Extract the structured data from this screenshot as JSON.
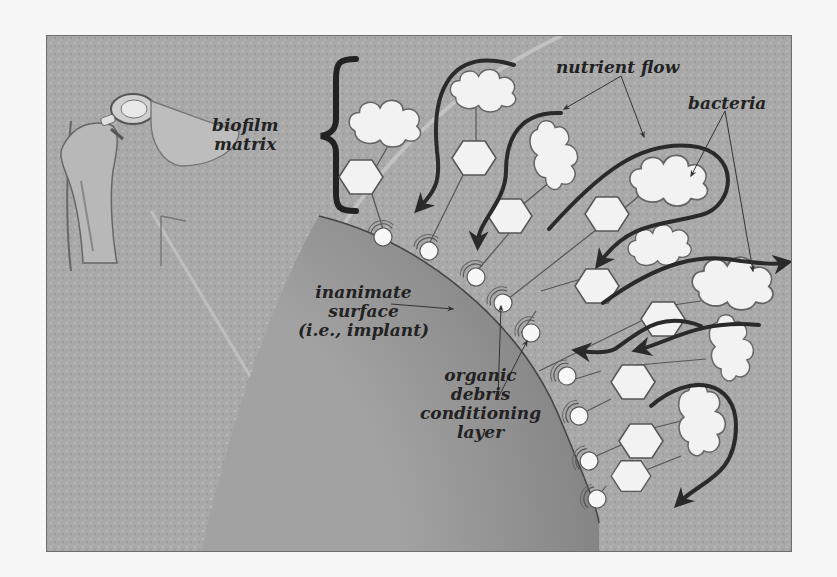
{
  "figure": {
    "labels": {
      "biofilm_matrix": [
        "biofilm",
        "matrix"
      ],
      "nutrient_flow": "nutrient flow",
      "bacteria": "bacteria",
      "inanimate_surface": [
        "inanimate",
        "surface",
        "(i.e., implant)"
      ],
      "conditioning_layer": [
        "organic",
        "debris",
        "conditioning",
        "layer"
      ]
    },
    "icons": {
      "hip_implant": "hip-joint-prosthesis-illustration",
      "brace": "curly-brace",
      "bacterium": "cloud-shaped-bacterium",
      "adhesin": "hexagon-molecule",
      "anchor": "conditioning-layer-particle",
      "flow_arrow": "curved-arrow"
    },
    "colors": {
      "background": "#a9a9a9",
      "surface": "#8f8f8f",
      "cell_fill": "#f2f2f2",
      "outline": "#555555",
      "arrow": "#2a2a2a",
      "text": "#222222"
    }
  }
}
